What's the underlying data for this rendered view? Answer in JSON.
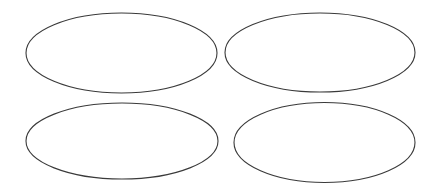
{
  "canvas": {
    "width": 438,
    "height": 190,
    "background": "#ffffff"
  },
  "style": {
    "stroke": "#3a3a3a",
    "stroke_width": 1.1,
    "fill": "none"
  },
  "shapes": [
    {
      "id": "ellipse-top-left",
      "type": "ellipse",
      "cx": 121.5,
      "cy": 53,
      "rx": 95.5,
      "ry": 40
    },
    {
      "id": "ellipse-top-right",
      "type": "ellipse",
      "cx": 320,
      "cy": 52.5,
      "rx": 95,
      "ry": 39.5
    },
    {
      "id": "ellipse-bottom-left",
      "type": "ellipse",
      "cx": 122,
      "cy": 141,
      "rx": 96,
      "ry": 38
    },
    {
      "id": "ellipse-bottom-right",
      "type": "ellipse",
      "cx": 324.5,
      "cy": 142.5,
      "rx": 90.5,
      "ry": 40
    }
  ]
}
